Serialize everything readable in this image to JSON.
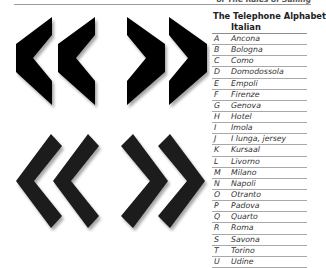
{
  "running_head": "of The Rules of Sailing",
  "figure": {
    "top_row": [
      "block-chevron-left",
      "block-chevron-left",
      "block-chevron-right",
      "block-chevron-right"
    ],
    "bottom_row": [
      "line-chevron-left",
      "line-chevron-left",
      "line-chevron-right",
      "line-chevron-right"
    ],
    "fill_color": "#000000"
  },
  "alphabet": {
    "title": "The Telephone Alphabet",
    "subtitle": "Italian",
    "rows": [
      {
        "letter": "A",
        "word": "Ancona"
      },
      {
        "letter": "B",
        "word": "Bologna"
      },
      {
        "letter": "C",
        "word": "Como"
      },
      {
        "letter": "D",
        "word": "Domodossola"
      },
      {
        "letter": "E",
        "word": "Empoli"
      },
      {
        "letter": "F",
        "word": "Firenze"
      },
      {
        "letter": "G",
        "word": "Genova"
      },
      {
        "letter": "H",
        "word": "Hotel"
      },
      {
        "letter": "I",
        "word": "Imola"
      },
      {
        "letter": "J",
        "word": "I lunga, jersey"
      },
      {
        "letter": "K",
        "word": "Kursaal"
      },
      {
        "letter": "L",
        "word": "Livorno"
      },
      {
        "letter": "M",
        "word": "Milano"
      },
      {
        "letter": "N",
        "word": "Napoli"
      },
      {
        "letter": "O",
        "word": "Otranto"
      },
      {
        "letter": "P",
        "word": "Padova"
      },
      {
        "letter": "Q",
        "word": "Quarto"
      },
      {
        "letter": "R",
        "word": "Roma"
      },
      {
        "letter": "S",
        "word": "Savona"
      },
      {
        "letter": "T",
        "word": "Torino"
      },
      {
        "letter": "U",
        "word": "Udine"
      }
    ]
  }
}
